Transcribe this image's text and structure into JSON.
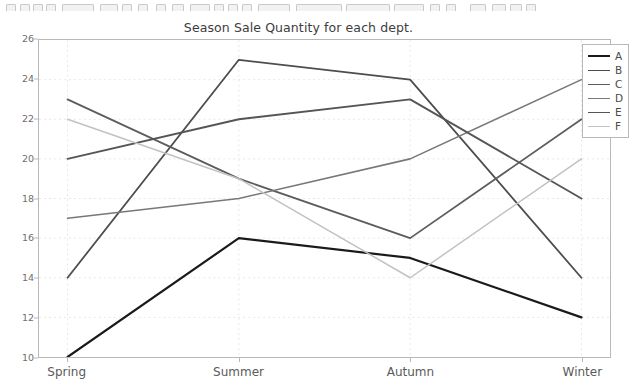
{
  "toolbar": {
    "description": "partially visible application toolbar strip"
  },
  "chart_data": {
    "type": "line",
    "title": "Season Sale Quantity for each dept.",
    "xlabel": "",
    "ylabel": "",
    "categories": [
      "Spring",
      "Summer",
      "Autumn",
      "Winter"
    ],
    "ylim": [
      10,
      26
    ],
    "yticks": [
      10,
      12,
      14,
      16,
      18,
      20,
      22,
      24,
      26
    ],
    "grid": true,
    "legend_position": "upper right",
    "series": [
      {
        "name": "A",
        "values": [
          10,
          16,
          15,
          12
        ],
        "color": "#1a1a1a",
        "width": 2.2
      },
      {
        "name": "B",
        "values": [
          14,
          25,
          24,
          14
        ],
        "color": "#4d4d4d",
        "width": 1.8
      },
      {
        "name": "C",
        "values": [
          23,
          19,
          16,
          22
        ],
        "color": "#5c5c5c",
        "width": 1.8
      },
      {
        "name": "D",
        "values": [
          17,
          18,
          20,
          24
        ],
        "color": "#787878",
        "width": 1.6
      },
      {
        "name": "E",
        "values": [
          20,
          22,
          23,
          18
        ],
        "color": "#555555",
        "width": 1.9
      },
      {
        "name": "F",
        "values": [
          22,
          19,
          14,
          20
        ],
        "color": "#c2c2c2",
        "width": 1.5
      }
    ]
  },
  "legend": {
    "entries": [
      {
        "label": "A"
      },
      {
        "label": "B"
      },
      {
        "label": "C"
      },
      {
        "label": "D"
      },
      {
        "label": "E"
      },
      {
        "label": "F"
      }
    ]
  },
  "colors": {
    "axis": "#b8b8b8",
    "grid": "#e8e8e8",
    "tick_text": "#6e6e6e",
    "title_text": "#3d3d3d",
    "background": "#ffffff"
  }
}
